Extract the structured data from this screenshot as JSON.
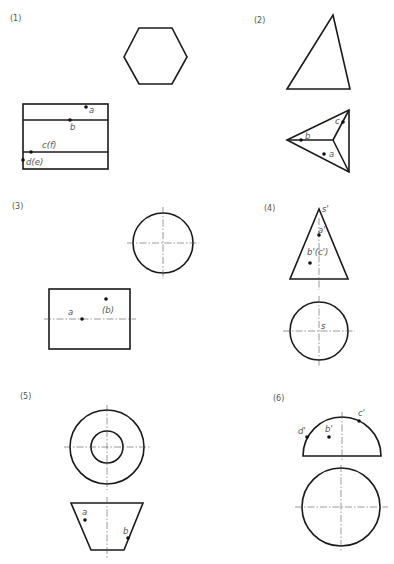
{
  "figure": {
    "panels": [
      {
        "id": "1",
        "label": "(1)",
        "solid": "hexagonal prism",
        "views": [
          "top view: regular hexagon",
          "front view: rectangle with two horizontal edge lines"
        ],
        "points": [
          {
            "name": "a",
            "label": "a"
          },
          {
            "name": "b",
            "label": "b"
          },
          {
            "name": "c(f)",
            "label": "c(f)"
          },
          {
            "name": "d(e)",
            "label": "d(e)"
          }
        ]
      },
      {
        "id": "2",
        "label": "(2)",
        "solid": "triangular pyramid",
        "views": [
          "front view: triangle",
          "top view: triangle with lateral edges to apex"
        ],
        "points": [
          {
            "name": "a",
            "label": "a"
          },
          {
            "name": "b",
            "label": "b"
          },
          {
            "name": "c",
            "label": "c"
          }
        ]
      },
      {
        "id": "3",
        "label": "(3)",
        "solid": "cylinder",
        "views": [
          "side view: circle with centerlines",
          "front view: rectangle with axis line"
        ],
        "points": [
          {
            "name": "a",
            "label": "a"
          },
          {
            "name": "b",
            "label": "(b)"
          }
        ]
      },
      {
        "id": "4",
        "label": "(4)",
        "solid": "cone",
        "views": [
          "front view: triangle with apex s'",
          "top view: circle with center s"
        ],
        "points": [
          {
            "name": "s'",
            "label": "s'"
          },
          {
            "name": "a'",
            "label": "a'"
          },
          {
            "name": "b'(c')",
            "label": "b'(c')"
          },
          {
            "name": "s",
            "label": "s"
          }
        ]
      },
      {
        "id": "5",
        "label": "(5)",
        "solid": "truncated cone (frustum)",
        "views": [
          "top view: two concentric circles",
          "front view: trapezoid"
        ],
        "points": [
          {
            "name": "a",
            "label": "a"
          },
          {
            "name": "b",
            "label": "b"
          }
        ]
      },
      {
        "id": "6",
        "label": "(6)",
        "solid": "hemisphere",
        "views": [
          "front view: semicircle",
          "top view: circle"
        ],
        "points": [
          {
            "name": "d'",
            "label": "d'"
          },
          {
            "name": "b'",
            "label": "b'"
          },
          {
            "name": "c'",
            "label": "c'"
          }
        ]
      }
    ]
  }
}
